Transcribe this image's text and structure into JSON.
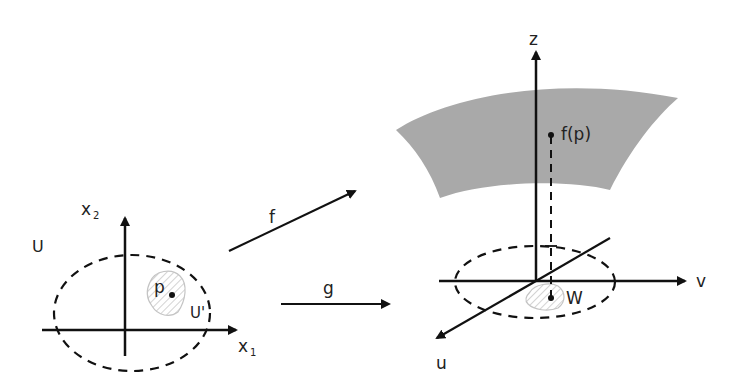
{
  "diagram": {
    "domain_labels": {
      "U": "U",
      "U_prime": "U'",
      "x1": "x",
      "x1_sub": "1",
      "x2": "x",
      "x2_sub": "2",
      "p": "p"
    },
    "maps": {
      "f": "f",
      "g": "g"
    },
    "target_labels": {
      "z": "z",
      "v": "v",
      "u": "u",
      "W": "W",
      "fp": "f(p)"
    },
    "colors": {
      "surface": "#a9a9a9",
      "stroke": "#111111",
      "hatch": "#b8b8b8"
    }
  }
}
